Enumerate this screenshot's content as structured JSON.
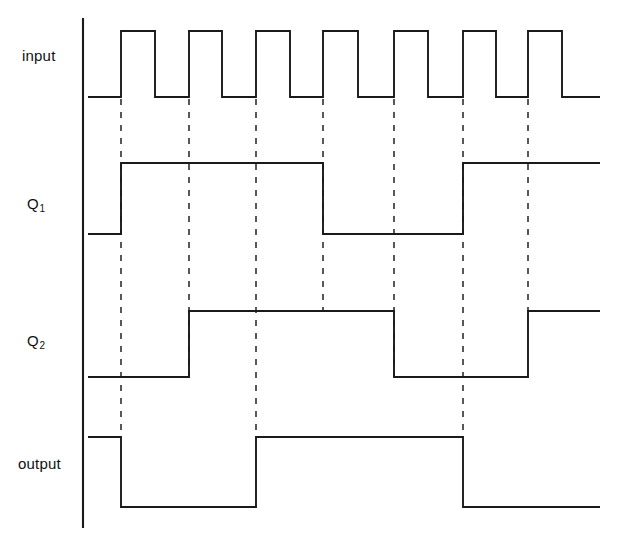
{
  "figure": {
    "kind": "digital-timing-diagram",
    "width": 621,
    "height": 545,
    "background_color": "#ffffff",
    "line_color": "#1a1a1a",
    "axis_color": "#1a1a1a",
    "dash_color": "#222222"
  },
  "labels": {
    "input": "input",
    "q1_base": "Q",
    "q1_sub": "1",
    "q2_base": "Q",
    "q2_sub": "2",
    "output": "output"
  },
  "chart_data": {
    "type": "line",
    "title": "",
    "xlabel": "",
    "ylabel": "",
    "grid": false,
    "legend": "none",
    "axis": {
      "x": 83,
      "y_top": 18,
      "y_bottom": 528
    },
    "time_axis": {
      "x_start": 83,
      "x_end": 600,
      "clock_period_px": 67.2,
      "clock_edge_positions": [
        121,
        189,
        256,
        323,
        394,
        463,
        528
      ],
      "dashed_reference_lines": [
        121,
        189,
        256,
        323,
        394,
        463,
        528
      ]
    },
    "signals": [
      {
        "name": "input",
        "label": "input",
        "level_high_y": 31,
        "level_low_y": 97,
        "initial_level": "low",
        "segments": [
          {
            "from": 88,
            "to": 121,
            "level": "low"
          },
          {
            "from": 121,
            "to": 155,
            "level": "high"
          },
          {
            "from": 155,
            "to": 189,
            "level": "low"
          },
          {
            "from": 189,
            "to": 222,
            "level": "high"
          },
          {
            "from": 222,
            "to": 256,
            "level": "low"
          },
          {
            "from": 256,
            "to": 290,
            "level": "high"
          },
          {
            "from": 290,
            "to": 323,
            "level": "low"
          },
          {
            "from": 323,
            "to": 358,
            "level": "high"
          },
          {
            "from": 358,
            "to": 394,
            "level": "low"
          },
          {
            "from": 394,
            "to": 428,
            "level": "high"
          },
          {
            "from": 428,
            "to": 463,
            "level": "low"
          },
          {
            "from": 463,
            "to": 496,
            "level": "high"
          },
          {
            "from": 496,
            "to": 528,
            "level": "low"
          },
          {
            "from": 528,
            "to": 562,
            "level": "high"
          },
          {
            "from": 562,
            "to": 600,
            "level": "low"
          }
        ]
      },
      {
        "name": "q1",
        "label": "Q1",
        "level_high_y": 163,
        "level_low_y": 234,
        "initial_level": "low",
        "segments": [
          {
            "from": 88,
            "to": 121,
            "level": "low"
          },
          {
            "from": 121,
            "to": 323,
            "level": "high"
          },
          {
            "from": 323,
            "to": 463,
            "level": "low"
          },
          {
            "from": 463,
            "to": 600,
            "level": "high"
          }
        ]
      },
      {
        "name": "q2",
        "label": "Q2",
        "level_high_y": 311,
        "level_low_y": 377,
        "initial_level": "low",
        "segments": [
          {
            "from": 88,
            "to": 189,
            "level": "low"
          },
          {
            "from": 189,
            "to": 394,
            "level": "high"
          },
          {
            "from": 394,
            "to": 528,
            "level": "low"
          },
          {
            "from": 528,
            "to": 600,
            "level": "high"
          }
        ]
      },
      {
        "name": "output",
        "label": "output",
        "level_high_y": 437,
        "level_low_y": 507,
        "initial_level": "high",
        "segments": [
          {
            "from": 88,
            "to": 121,
            "level": "high"
          },
          {
            "from": 121,
            "to": 256,
            "level": "low"
          },
          {
            "from": 256,
            "to": 463,
            "level": "high"
          },
          {
            "from": 463,
            "to": 600,
            "level": "low"
          }
        ]
      }
    ],
    "dash_spans": [
      {
        "x": 121,
        "y_from": 99,
        "y_to": 437
      },
      {
        "x": 189,
        "y_from": 99,
        "y_to": 377
      },
      {
        "x": 256,
        "y_from": 99,
        "y_to": 437
      },
      {
        "x": 323,
        "y_from": 99,
        "y_to": 311
      },
      {
        "x": 394,
        "y_from": 99,
        "y_to": 377
      },
      {
        "x": 463,
        "y_from": 99,
        "y_to": 437
      },
      {
        "x": 528,
        "y_from": 99,
        "y_to": 311
      }
    ]
  }
}
